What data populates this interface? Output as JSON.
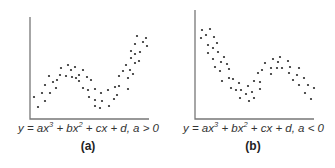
{
  "chart_data": [
    {
      "type": "scatter",
      "panel_label": "(a)",
      "title": "",
      "equation": {
        "lhs": "y = ax",
        "exp1": "3",
        "mid1": " + bx",
        "exp2": "2",
        "rest": " + cx + d, a > 0"
      },
      "xlabel": "",
      "ylabel": "",
      "grid": false,
      "legend": null,
      "shape": "cubic, rises-falls-rises (a > 0)",
      "axes": {
        "origin": [
          30,
          119
        ],
        "x_end": 149,
        "y_top": 17
      },
      "points": [
        [
          34,
          97
        ],
        [
          38,
          107
        ],
        [
          42,
          93
        ],
        [
          45,
          101
        ],
        [
          45,
          85
        ],
        [
          49,
          76
        ],
        [
          50,
          93
        ],
        [
          53,
          82
        ],
        [
          56,
          88
        ],
        [
          57,
          80
        ],
        [
          60,
          75
        ],
        [
          61,
          68
        ],
        [
          66,
          76
        ],
        [
          68,
          65
        ],
        [
          71,
          70
        ],
        [
          72,
          77
        ],
        [
          75,
          67
        ],
        [
          76,
          78
        ],
        [
          79,
          75
        ],
        [
          79,
          81
        ],
        [
          83,
          70
        ],
        [
          83,
          88
        ],
        [
          87,
          77
        ],
        [
          88,
          90
        ],
        [
          91,
          80
        ],
        [
          89,
          97
        ],
        [
          95,
          89
        ],
        [
          95,
          100
        ],
        [
          95,
          106
        ],
        [
          100,
          108
        ],
        [
          101,
          93
        ],
        [
          102,
          101
        ],
        [
          108,
          90
        ],
        [
          109,
          106
        ],
        [
          115,
          87
        ],
        [
          114,
          99
        ],
        [
          117,
          95
        ],
        [
          119,
          86
        ],
        [
          119,
          76
        ],
        [
          123,
          71
        ],
        [
          126,
          65
        ],
        [
          128,
          78
        ],
        [
          128,
          89
        ],
        [
          130,
          70
        ],
        [
          131,
          51
        ],
        [
          131,
          58
        ],
        [
          133,
          74
        ],
        [
          135,
          44
        ],
        [
          135,
          54
        ],
        [
          135,
          63
        ],
        [
          137,
          36
        ],
        [
          140,
          52
        ],
        [
          139,
          61
        ],
        [
          143,
          42
        ],
        [
          146,
          38
        ],
        [
          147,
          46
        ]
      ]
    },
    {
      "type": "scatter",
      "panel_label": "(b)",
      "title": "",
      "equation": {
        "lhs": "y = ax",
        "exp1": "3",
        "mid1": " + bx",
        "exp2": "2",
        "rest": " + cx + d, a < 0"
      },
      "xlabel": "",
      "ylabel": "",
      "grid": false,
      "legend": null,
      "shape": "cubic, falls-rises-falls (a < 0)",
      "axes": {
        "origin": [
          195,
          119
        ],
        "x_end": 314,
        "y_top": 10
      },
      "points": [
        [
          202,
          30
        ],
        [
          201,
          38
        ],
        [
          206,
          35
        ],
        [
          210,
          29
        ],
        [
          208,
          45
        ],
        [
          214,
          37
        ],
        [
          213,
          48
        ],
        [
          208,
          53
        ],
        [
          217,
          43
        ],
        [
          218,
          52
        ],
        [
          213,
          59
        ],
        [
          215,
          67
        ],
        [
          221,
          62
        ],
        [
          224,
          57
        ],
        [
          220,
          71
        ],
        [
          227,
          64
        ],
        [
          229,
          69
        ],
        [
          222,
          81
        ],
        [
          229,
          78
        ],
        [
          233,
          79
        ],
        [
          231,
          88
        ],
        [
          239,
          83
        ],
        [
          236,
          90
        ],
        [
          241,
          90
        ],
        [
          240,
          98
        ],
        [
          246,
          94
        ],
        [
          248,
          86
        ],
        [
          249,
          101
        ],
        [
          252,
          92
        ],
        [
          254,
          98
        ],
        [
          254,
          81
        ],
        [
          260,
          89
        ],
        [
          260,
          82
        ],
        [
          258,
          73
        ],
        [
          262,
          70
        ],
        [
          265,
          63
        ],
        [
          271,
          74
        ],
        [
          271,
          68
        ],
        [
          273,
          59
        ],
        [
          277,
          68
        ],
        [
          278,
          62
        ],
        [
          280,
          57
        ],
        [
          282,
          68
        ],
        [
          288,
          61
        ],
        [
          289,
          73
        ],
        [
          290,
          67
        ],
        [
          293,
          80
        ],
        [
          297,
          75
        ],
        [
          299,
          68
        ],
        [
          299,
          85
        ],
        [
          304,
          78
        ],
        [
          305,
          93
        ],
        [
          308,
          85
        ],
        [
          311,
          99
        ],
        [
          314,
          88
        ]
      ]
    }
  ],
  "colors": {
    "axis": "#777777",
    "dot": "#2a2a2a",
    "text": "#333333"
  }
}
